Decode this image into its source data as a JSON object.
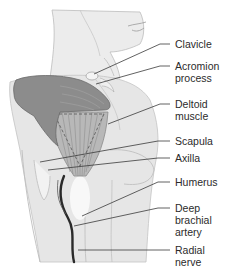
{
  "diagram": {
    "type": "anatomical-illustration",
    "colors": {
      "skin": "#e4e4e4",
      "skin_shadow": "#cfcfcf",
      "hand": "#8a8a8a",
      "muscle": "#b5b5b5",
      "artery": "#2a2a2a",
      "leader_line": "#3a3a3a",
      "text": "#2b2b2b"
    },
    "labels": [
      {
        "id": "clavicle",
        "text": "Clavicle"
      },
      {
        "id": "acromion",
        "text": "Acromion\nprocess"
      },
      {
        "id": "deltoid",
        "text": "Deltoid\nmuscle"
      },
      {
        "id": "scapula",
        "text": "Scapula"
      },
      {
        "id": "axilla",
        "text": "Axilla"
      },
      {
        "id": "humerus",
        "text": "Humerus"
      },
      {
        "id": "deep-brachial-artery",
        "text": "Deep\nbrachial\nartery"
      },
      {
        "id": "radial-nerve",
        "text": "Radial\nnerve"
      }
    ]
  }
}
